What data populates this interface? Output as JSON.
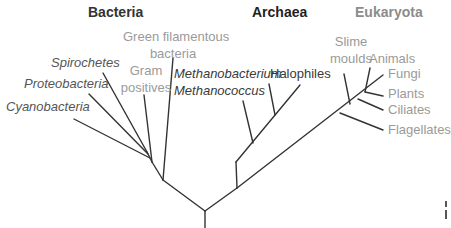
{
  "colors": {
    "line": "#333333",
    "bacteria_heading": "#333333",
    "archaea_heading": "#1f1f1f",
    "eukaryota_heading": "#8c8c8c",
    "italic_label": "#555555",
    "plain_label_light": "#9a9a9a",
    "archaea_label": "#3a3a3a"
  },
  "domains": {
    "bacteria": "Bacteria",
    "archaea": "Archaea",
    "eukaryota": "Eukaryota"
  },
  "bacteria": {
    "green_filamentous_line1": "Green filamentous",
    "green_filamentous_line2": "bacteria",
    "gram_line1": "Gram",
    "gram_line2": "positives",
    "spirochetes": "Spirochetes",
    "proteobacteria": "Proteobacteria",
    "cyanobacteria": "Cyanobacteria"
  },
  "archaea": {
    "methanobacterium": "Methanobacterium",
    "methanococcus": "Methanococcus",
    "halophiles": "Halophiles"
  },
  "eukaryota": {
    "slime_line1": "Slime",
    "slime_line2": "moulds",
    "animals": "Animals",
    "fungi": "Fungi",
    "plants": "Plants",
    "ciliates": "Ciliates",
    "flagellates": "Flagellates"
  }
}
